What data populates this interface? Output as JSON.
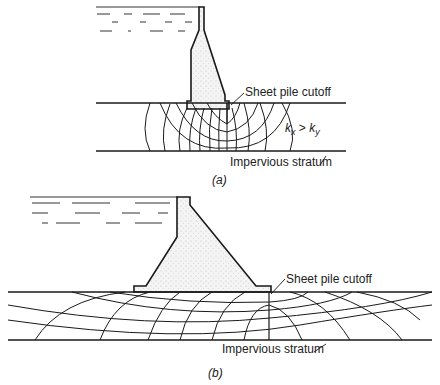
{
  "figure_a": {
    "caption": "(a)",
    "labels": {
      "sheet_pile": "Sheet pile cutoff",
      "impervious": "Impervious stratum",
      "anisotropy_k1": "k",
      "anisotropy_sub_x": "x",
      "anisotropy_gt": " > ",
      "anisotropy_k2": "k",
      "anisotropy_sub_y": "y"
    }
  },
  "figure_b": {
    "caption": "(b)",
    "labels": {
      "sheet_pile": "Sheet pile cutoff",
      "impervious": "Impervious stratum"
    }
  },
  "colors": {
    "line": "#1a1a1a",
    "dam_fill": "#ececec",
    "background": "#ffffff"
  }
}
